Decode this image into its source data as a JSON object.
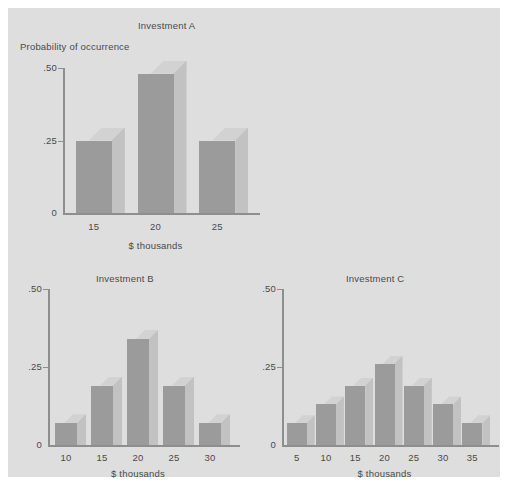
{
  "figure": {
    "background_color": "#dedede",
    "page_color": "#ffffff",
    "bar_face_color": "#9b9b9b",
    "bar_side_color": "#c2c2c2",
    "bar_top_color": "#d2d2d2",
    "axis_color": "#8e8e8e",
    "text_color": "#4a4a4a",
    "caption": ""
  },
  "chart_data": [
    {
      "type": "bar",
      "id": "investment-a",
      "title": "Investment A",
      "ylabel": "Probability of occurrence",
      "xlabel": "$ thousands",
      "categories": [
        "15",
        "20",
        "25"
      ],
      "values": [
        0.25,
        0.48,
        0.25
      ],
      "ytick_labels": [
        ".50",
        ".25",
        "0"
      ],
      "ytick_values": [
        0.5,
        0.25,
        0
      ],
      "ylim": [
        0,
        0.5
      ],
      "grid": false,
      "legend": "none"
    },
    {
      "type": "bar",
      "id": "investment-b",
      "title": "Investment B",
      "ylabel": "",
      "xlabel": "$ thousands",
      "categories": [
        "10",
        "15",
        "20",
        "25",
        "30"
      ],
      "values": [
        0.07,
        0.19,
        0.34,
        0.19,
        0.07
      ],
      "ytick_labels": [
        ".50",
        ".25",
        "0"
      ],
      "ytick_values": [
        0.5,
        0.25,
        0
      ],
      "ylim": [
        0,
        0.5
      ],
      "grid": false,
      "legend": "none"
    },
    {
      "type": "bar",
      "id": "investment-c",
      "title": "Investment C",
      "ylabel": "",
      "xlabel": "$ thousands",
      "categories": [
        "5",
        "10",
        "15",
        "20",
        "25",
        "30",
        "35"
      ],
      "values": [
        0.07,
        0.13,
        0.19,
        0.26,
        0.19,
        0.13,
        0.07
      ],
      "ytick_labels": [
        ".50",
        ".25",
        "0"
      ],
      "ytick_values": [
        0.5,
        0.25,
        0
      ],
      "ylim": [
        0,
        0.5
      ],
      "grid": false,
      "legend": "none"
    }
  ]
}
